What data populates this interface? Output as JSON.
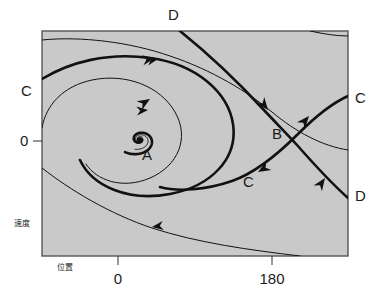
{
  "figure": {
    "kind": "phase-portrait",
    "plot_area": {
      "x": 42,
      "y": 31,
      "width": 306,
      "height": 225
    },
    "background_color": "#c9c9c9",
    "border_color": "#555555",
    "curve_color": "#111111"
  },
  "axes": {
    "x": {
      "label": "位置",
      "label_pos": {
        "x": 57,
        "y": 264
      },
      "ticks": [
        {
          "label": "0",
          "px": 118
        },
        {
          "label": "180",
          "px": 272
        }
      ]
    },
    "y": {
      "label": "速度",
      "label_pos": {
        "x": 14,
        "y": 220
      },
      "ticks": [
        {
          "label": "0",
          "py": 141
        }
      ]
    }
  },
  "annotations": [
    {
      "name": "label-d-top",
      "text": "D",
      "x": 168,
      "y": 7
    },
    {
      "name": "label-c-left",
      "text": "C",
      "x": 21,
      "y": 83
    },
    {
      "name": "label-c-right",
      "text": "C",
      "x": 355,
      "y": 90
    },
    {
      "name": "label-d-right",
      "text": "D",
      "x": 355,
      "y": 188
    },
    {
      "name": "label-b-saddle",
      "text": "B",
      "x": 272,
      "y": 126
    },
    {
      "name": "label-c-middle",
      "text": "C",
      "x": 243,
      "y": 174
    },
    {
      "name": "label-a-focus",
      "text": "A",
      "x": 142,
      "y": 147
    }
  ],
  "chart_data": {
    "type": "line",
    "title": "",
    "xlabel": "位置",
    "ylabel": "速度",
    "xticks": [
      "0",
      "180"
    ],
    "yticks": [
      "0"
    ],
    "grid": false,
    "legend": null,
    "features": [
      {
        "name": "A",
        "type": "stable-spiral-focus",
        "x": 0,
        "y": 0
      },
      {
        "name": "B",
        "type": "saddle-point",
        "x": 180,
        "y": 0
      },
      {
        "name": "C",
        "type": "stable-separatrix"
      },
      {
        "name": "D",
        "type": "unstable-separatrix"
      }
    ]
  }
}
